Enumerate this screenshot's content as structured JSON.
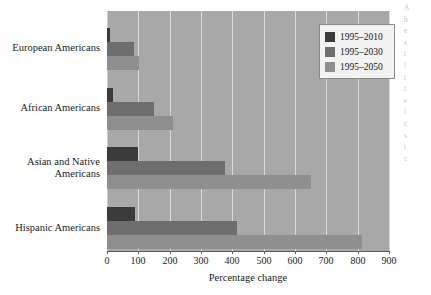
{
  "chart_data": {
    "type": "bar",
    "orientation": "horizontal",
    "title": "",
    "xlabel": "Percentage change",
    "ylabel": "",
    "xlim": [
      0,
      900
    ],
    "xticks": [
      0,
      100,
      200,
      300,
      400,
      500,
      600,
      700,
      800,
      900
    ],
    "xtick_labels": [
      "0",
      "100",
      "200",
      "300",
      "400",
      "500",
      "600",
      "700",
      "800",
      "900"
    ],
    "grid": "vertical",
    "legend_position": "top-right",
    "categories": [
      "European Americans",
      "African Americans",
      "Asian and Native\nAmericans",
      "Hispanic Americans"
    ],
    "series": [
      {
        "name": "1995–2010",
        "color": "#3b3b3b",
        "values": [
          10,
          20,
          100,
          88
        ]
      },
      {
        "name": "1995–2030",
        "color": "#6e6e6e",
        "values": [
          85,
          150,
          375,
          415
        ]
      },
      {
        "name": "1995–2050",
        "color": "#8f8f8f",
        "values": [
          103,
          210,
          650,
          815
        ]
      }
    ],
    "plot_background": "#a8a8a8",
    "gridline_color": "#d9d9d9"
  },
  "legend": {
    "entries": [
      {
        "label": "1995–2010"
      },
      {
        "label": "1995–2030"
      },
      {
        "label": "1995–2050"
      }
    ]
  },
  "axis": {
    "x_title": "Percentage change"
  },
  "page_text": {
    "lines": [
      "A",
      "h",
      "",
      "e",
      "s",
      "t",
      "l",
      "",
      "t",
      "t",
      "e",
      "",
      "l",
      "c",
      "s",
      "t",
      "c"
    ]
  }
}
